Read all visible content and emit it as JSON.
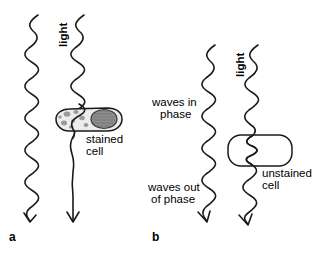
{
  "figure": {
    "width": 332,
    "height": 255,
    "background_color": "#ffffff",
    "ink_color": "#1a1a1a",
    "type": "scientific-diagram"
  },
  "panel_a": {
    "letter": "a",
    "light_label": "light",
    "cell_label_line1": "stained",
    "cell_label_line2": "cell",
    "cell_fill_color": "#ececec",
    "nucleus_color": "#8e8e8e",
    "granule_color": "#9a9a9a",
    "wave_count": 2,
    "description": "Two light waves travel downward; the right wave passes through a stained cell and is absorbed, emerging as a straight flattened line with no amplitude."
  },
  "panel_b": {
    "letter": "b",
    "light_label": "light",
    "in_phase_line1": "waves in",
    "in_phase_line2": "phase",
    "out_of_phase_line1": "waves out",
    "out_of_phase_line2": "of phase",
    "cell_label_line1": "unstained",
    "cell_label_line2": "cell",
    "cell_fill_color": "#ffffff",
    "wave_count": 2,
    "description": "Two light waves travel downward in phase; the right wave passes through an unstained cell, is retarded, and emerges out of phase with the left wave."
  }
}
